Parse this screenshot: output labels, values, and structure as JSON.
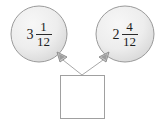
{
  "diagram": {
    "type": "fraction-addition-bubble-diagram",
    "background_color": "#ffffff",
    "bubble_fill_color": "#ececec",
    "bubble_stroke_color": "#9a9a9a",
    "line_color": "#a8a8a8",
    "text_color": "#1c1c1c",
    "bubbles": [
      {
        "name": "left-bubble",
        "whole": "3",
        "numerator": "1",
        "denominator": "12"
      },
      {
        "name": "right-bubble",
        "whole": "2",
        "numerator": "4",
        "denominator": "12"
      }
    ],
    "answer_box": {
      "value": "",
      "placeholder": ""
    },
    "connectors": [
      {
        "name": "left-connector",
        "arrow": "arrowhead-icon"
      },
      {
        "name": "right-connector",
        "arrow": "arrowhead-icon"
      }
    ]
  }
}
